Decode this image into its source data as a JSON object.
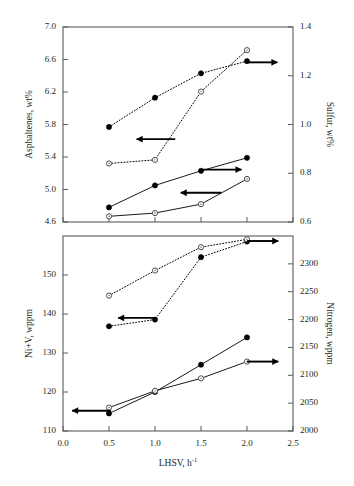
{
  "chart_data": [
    {
      "panel": "top",
      "type": "line",
      "xlabel": "",
      "xlim": [
        0.0,
        2.5
      ],
      "xticks": [
        0.0,
        0.5,
        1.0,
        1.5,
        2.0,
        2.5
      ],
      "ylabel": "Asphaltenes, wt%",
      "ylim": [
        4.6,
        7.0
      ],
      "yticks": [
        4.6,
        5.0,
        5.4,
        5.8,
        6.2,
        6.6,
        7.0
      ],
      "y2label": "Sulfur, wt%",
      "y2lim": [
        0.6,
        1.4
      ],
      "y2ticks": [
        0.6,
        0.8,
        1.0,
        1.2,
        1.4
      ],
      "grid": false,
      "legend": "none",
      "series": [
        {
          "name": "sulfur-filled-dotted",
          "axis": "right",
          "marker": "filled-circle",
          "linestyle": "dotted",
          "arrow": "right",
          "x": [
            0.5,
            1.0,
            1.5,
            2.0
          ],
          "y": [
            0.99,
            1.11,
            1.21,
            1.26
          ]
        },
        {
          "name": "sulfur-open-dotted",
          "axis": "right",
          "marker": "open-circle",
          "linestyle": "dotted",
          "arrow": "right",
          "x": [
            0.5,
            1.0,
            1.5,
            2.0
          ],
          "y": [
            0.84,
            0.855,
            1.135,
            1.305
          ]
        },
        {
          "name": "asphaltenes-filled-solid",
          "axis": "left",
          "marker": "filled-circle",
          "linestyle": "solid",
          "arrow": "left",
          "x": [
            0.5,
            1.0,
            1.5,
            2.0
          ],
          "y": [
            4.78,
            5.05,
            5.23,
            5.39
          ]
        },
        {
          "name": "asphaltenes-open-solid",
          "axis": "left",
          "marker": "open-circle",
          "linestyle": "solid",
          "arrow": "left",
          "x": [
            0.5,
            1.0,
            1.5,
            2.0
          ],
          "y": [
            4.67,
            4.71,
            4.82,
            5.13
          ]
        }
      ],
      "annotations": [
        {
          "name": "arrow-to-left-axis-sulfur-group",
          "direction": "left",
          "x0": 1.22,
          "x1": 0.8,
          "value_axis": "left",
          "value": 5.62
        },
        {
          "name": "arrow-to-right-axis-sulfur",
          "direction": "right",
          "x0": 2.02,
          "x1": 2.33,
          "value_axis": "right",
          "value": 1.255
        },
        {
          "name": "arrow-to-left-axis-asphaltenes",
          "direction": "left",
          "x0": 1.72,
          "x1": 1.28,
          "value_axis": "left",
          "value": 4.96
        },
        {
          "name": "arrow-to-right-axis-asphaltenes",
          "direction": "right",
          "x0": 1.5,
          "x1": 1.94,
          "value_axis": "left",
          "value": 5.245
        }
      ]
    },
    {
      "panel": "bottom",
      "type": "line",
      "xlabel": "LHSV, h",
      "xlabel_sup": "-1",
      "xlim": [
        0.0,
        2.5
      ],
      "xticks": [
        0.0,
        0.5,
        1.0,
        1.5,
        2.0,
        2.5
      ],
      "ylabel": "Ni+V, wppm",
      "ylim": [
        110,
        160
      ],
      "yticks": [
        110,
        120,
        130,
        140,
        150
      ],
      "y2label": "Nitrogen, wppm",
      "y2lim": [
        2000,
        2350
      ],
      "y2ticks": [
        2000,
        2050,
        2100,
        2150,
        2200,
        2250,
        2300
      ],
      "grid": false,
      "legend": "none",
      "series": [
        {
          "name": "nitrogen-filled-dotted",
          "axis": "right",
          "marker": "filled-circle",
          "linestyle": "dotted",
          "arrow": "left",
          "x": [
            0.5,
            1.0,
            1.5,
            2.0
          ],
          "y": [
            2188,
            2200,
            2312,
            2340
          ]
        },
        {
          "name": "nitrogen-open-dotted",
          "axis": "right",
          "marker": "open-circle",
          "linestyle": "dotted",
          "arrow": "right",
          "x": [
            0.5,
            1.0,
            1.5,
            2.0
          ],
          "y": [
            2243,
            2288,
            2330,
            2344
          ]
        },
        {
          "name": "nivplus-filled-solid",
          "axis": "left",
          "marker": "filled-circle",
          "linestyle": "solid",
          "arrow": "none",
          "x": [
            0.5,
            1.0,
            1.5,
            2.0
          ],
          "y": [
            114.5,
            120.0,
            127.0,
            134.0
          ]
        },
        {
          "name": "nivplus-open-solid",
          "axis": "left",
          "marker": "open-circle",
          "linestyle": "solid",
          "arrow": "right",
          "x": [
            0.5,
            1.0,
            1.5,
            2.0
          ],
          "y": [
            116.0,
            120.3,
            123.5,
            127.8
          ]
        }
      ],
      "annotations": [
        {
          "name": "arrow-to-left-axis-nitrogen",
          "direction": "left",
          "x0": 1.02,
          "x1": 0.6,
          "value_axis": "right",
          "value": 2203
        },
        {
          "name": "arrow-to-right-axis-nitrogen",
          "direction": "right",
          "x0": 2.0,
          "x1": 2.34,
          "value_axis": "right",
          "value": 2341
        },
        {
          "name": "arrow-to-left-axis-niv",
          "direction": "left",
          "x0": 0.52,
          "x1": 0.1,
          "value_axis": "left",
          "value": 115.2
        },
        {
          "name": "arrow-to-right-axis-niv",
          "direction": "right",
          "x0": 2.0,
          "x1": 2.34,
          "value_axis": "left",
          "value": 127.8
        }
      ]
    }
  ],
  "labels": {
    "top_left_axis_title": "Asphaltenes, wt%",
    "top_right_axis_title": "Sulfur, wt%",
    "bottom_left_axis_title": "Ni+V, wppm",
    "bottom_right_axis_title": "Nitrogen, wppm",
    "x_axis_title_base": "LHSV, h",
    "x_axis_title_exponent": "-1"
  },
  "colors": {
    "axis": "#58595b",
    "data": "#000000",
    "background": "#ffffff"
  }
}
